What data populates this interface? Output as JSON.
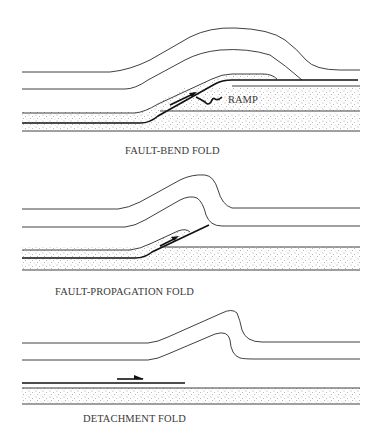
{
  "figure": {
    "panels": [
      {
        "id": "fault-bend-fold",
        "caption": "FAULT-BEND FOLD",
        "annotation": "RAMP"
      },
      {
        "id": "fault-propagation-fold",
        "caption": "FAULT-PROPAGATION FOLD"
      },
      {
        "id": "detachment-fold",
        "caption": "DETACHMENT FOLD"
      }
    ],
    "colors": {
      "line": "#2a2a2a",
      "fault": "#111111",
      "stipple": "#555555",
      "background": "#ffffff"
    }
  }
}
